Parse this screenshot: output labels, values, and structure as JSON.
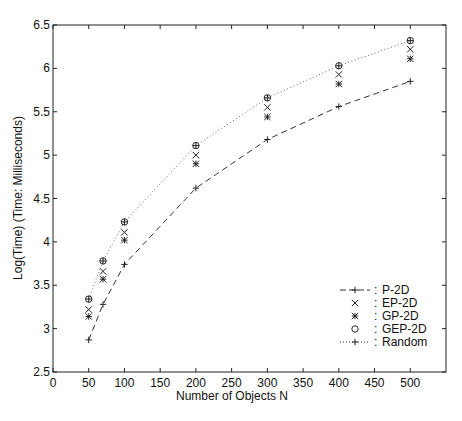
{
  "chart_data": {
    "type": "line",
    "title": "",
    "xlabel": "Number of Objects N",
    "ylabel": "Log(Time) (Time: Milliseconds)",
    "xlim": [
      0,
      550
    ],
    "ylim": [
      2.5,
      6.5
    ],
    "xticks": [
      0,
      50,
      100,
      150,
      200,
      250,
      300,
      350,
      400,
      450,
      500
    ],
    "yticks": [
      2.5,
      3,
      3.5,
      4,
      4.5,
      5,
      5.5,
      6,
      6.5
    ],
    "xtick_labels": [
      "0",
      "50",
      "100",
      "150",
      "200",
      "250",
      "300",
      "350",
      "400",
      "450",
      "500"
    ],
    "ytick_labels": [
      "2.5",
      "3",
      "3.5",
      "4",
      "4.5",
      "5",
      "5.5",
      "6",
      "6.5"
    ],
    "grid": false,
    "legend_position": "lower right",
    "x": [
      50,
      70,
      100,
      200,
      300,
      400,
      500
    ],
    "series": [
      {
        "name": "P-2D",
        "legend_label": "P-2D",
        "legend_symbol": "--+--:",
        "style": "dashed",
        "marker": "+",
        "values": [
          2.87,
          3.28,
          3.74,
          4.62,
          5.18,
          5.56,
          5.85
        ]
      },
      {
        "name": "EP-2D",
        "legend_label": "EP-2D",
        "legend_symbol": "x  :",
        "style": "none",
        "marker": "x",
        "values": [
          3.22,
          3.66,
          4.11,
          5.0,
          5.55,
          5.93,
          6.22
        ]
      },
      {
        "name": "GP-2D",
        "legend_label": "GP-2D",
        "legend_symbol": "*  :",
        "style": "none",
        "marker": "*",
        "values": [
          3.14,
          3.57,
          4.02,
          4.9,
          5.44,
          5.82,
          6.11
        ]
      },
      {
        "name": "GEP-2D",
        "legend_label": "GEP-2D",
        "legend_symbol": "o  :",
        "style": "none",
        "marker": "o",
        "values": [
          3.34,
          3.78,
          4.23,
          5.11,
          5.66,
          6.03,
          6.32
        ]
      },
      {
        "name": "Random",
        "legend_label": "Random",
        "legend_symbol": "....+....:",
        "style": "dotted",
        "marker": "+",
        "values": [
          3.34,
          3.78,
          4.23,
          5.11,
          5.66,
          6.03,
          6.32
        ]
      }
    ]
  }
}
